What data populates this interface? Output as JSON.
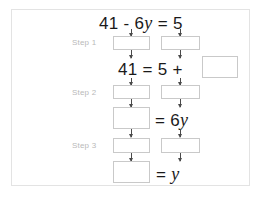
{
  "worksheet": {
    "title_equation": {
      "lhs_num": "41",
      "minus": "-",
      "coef": "6",
      "var": "y",
      "equals": "=",
      "rhs": "5",
      "full": "41 - 6y = 5"
    },
    "steps": [
      {
        "id": "step1",
        "label": "Step 1"
      },
      {
        "id": "step2",
        "label": "Step 2"
      },
      {
        "id": "step3",
        "label": "Step 3"
      }
    ],
    "equation_lines": [
      {
        "id": "line1",
        "text": "41 - 6y = 5"
      },
      {
        "id": "line2",
        "text": "41 = 5 +"
      },
      {
        "id": "line3",
        "text": "= 6y"
      },
      {
        "id": "line4",
        "text": "= y"
      }
    ],
    "line2": {
      "num": "41",
      "equals": "=",
      "rhs": "5",
      "plus": "+"
    },
    "line3": {
      "equals": "=",
      "coef": "6",
      "var": "y"
    },
    "line4": {
      "equals": "=",
      "var": "y"
    },
    "blanks": [
      {
        "id": "blank-step1-left",
        "value": ""
      },
      {
        "id": "blank-step1-right",
        "value": ""
      },
      {
        "id": "blank-line2-right",
        "value": ""
      },
      {
        "id": "blank-step2-left",
        "value": ""
      },
      {
        "id": "blank-step2-right",
        "value": ""
      },
      {
        "id": "blank-line3-left",
        "value": ""
      },
      {
        "id": "blank-step3-left",
        "value": ""
      },
      {
        "id": "blank-step3-right",
        "value": ""
      },
      {
        "id": "blank-line4-left",
        "value": ""
      }
    ],
    "colors": {
      "frame_border": "#e3e3e3",
      "box_border": "#c9c9c9",
      "text": "#1a1a1a",
      "step_label": "#b9b9b9",
      "arrow": "#4a4a4a",
      "background": "#ffffff"
    }
  }
}
